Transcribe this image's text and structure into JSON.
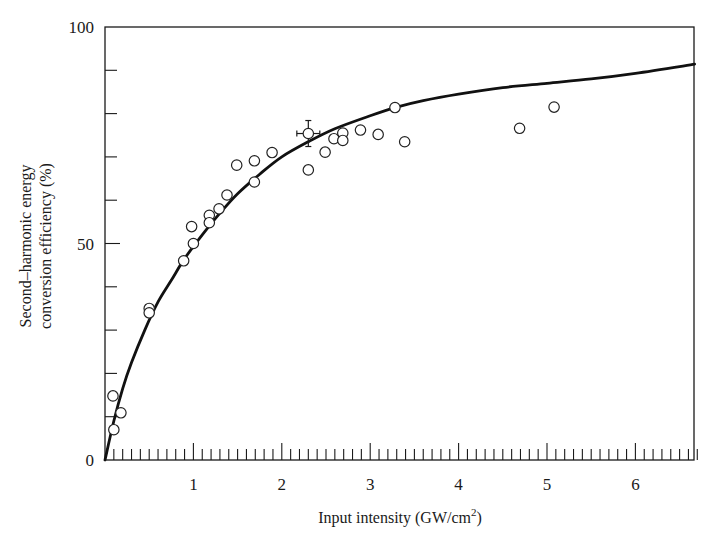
{
  "chart_data": {
    "type": "scatter",
    "title": "",
    "xlabel": "Input intensity (GW/cm²)",
    "xlabel_parts": {
      "main": "Input intensity (GW/cm",
      "sup": "2",
      "tail": ")"
    },
    "ylabel": "Second–harmonic energy conversion efficiency (%)",
    "ylabel_lines": [
      "Second–harmonic energy",
      "conversion efficiency (%)"
    ],
    "xlim": [
      0,
      6.7
    ],
    "ylim": [
      0,
      100
    ],
    "x_major_ticks": [
      1,
      2,
      3,
      4,
      5,
      6
    ],
    "x_minor_step": 0.1,
    "y_major_ticks": [
      0,
      50,
      100
    ],
    "y_minor_step": 10,
    "grid": false,
    "legend": null,
    "series": [
      {
        "name": "measured",
        "kind": "scatter",
        "marker": "open-circle",
        "points": [
          {
            "x": 0.09,
            "y": 14.8
          },
          {
            "x": 0.1,
            "y": 7.0
          },
          {
            "x": 0.18,
            "y": 10.9
          },
          {
            "x": 0.5,
            "y": 35.0
          },
          {
            "x": 0.5,
            "y": 34.0
          },
          {
            "x": 0.89,
            "y": 46.0
          },
          {
            "x": 0.98,
            "y": 53.9
          },
          {
            "x": 1.0,
            "y": 50.0
          },
          {
            "x": 1.18,
            "y": 56.5
          },
          {
            "x": 1.18,
            "y": 54.8
          },
          {
            "x": 1.29,
            "y": 58.0
          },
          {
            "x": 1.38,
            "y": 61.2
          },
          {
            "x": 1.49,
            "y": 68.1
          },
          {
            "x": 1.69,
            "y": 69.1
          },
          {
            "x": 1.69,
            "y": 64.2
          },
          {
            "x": 1.89,
            "y": 71.0
          },
          {
            "x": 2.3,
            "y": 75.4,
            "xerr": 0.13,
            "yerr": 3.0
          },
          {
            "x": 2.3,
            "y": 67.0
          },
          {
            "x": 2.49,
            "y": 71.1
          },
          {
            "x": 2.59,
            "y": 74.2
          },
          {
            "x": 2.69,
            "y": 75.5
          },
          {
            "x": 2.69,
            "y": 73.8
          },
          {
            "x": 2.89,
            "y": 76.2
          },
          {
            "x": 3.09,
            "y": 75.2
          },
          {
            "x": 3.28,
            "y": 81.4
          },
          {
            "x": 3.39,
            "y": 73.5
          },
          {
            "x": 4.69,
            "y": 76.6
          },
          {
            "x": 5.08,
            "y": 81.5
          }
        ]
      },
      {
        "name": "theory",
        "kind": "line",
        "points": [
          {
            "x": 0.0,
            "y": 0.0
          },
          {
            "x": 0.1,
            "y": 9.0
          },
          {
            "x": 0.2,
            "y": 16.5
          },
          {
            "x": 0.3,
            "y": 22.5
          },
          {
            "x": 0.45,
            "y": 30.0
          },
          {
            "x": 0.6,
            "y": 36.5
          },
          {
            "x": 0.75,
            "y": 41.5
          },
          {
            "x": 0.9,
            "y": 46.5
          },
          {
            "x": 1.1,
            "y": 52.0
          },
          {
            "x": 1.3,
            "y": 57.0
          },
          {
            "x": 1.5,
            "y": 61.5
          },
          {
            "x": 1.75,
            "y": 66.0
          },
          {
            "x": 2.0,
            "y": 70.0
          },
          {
            "x": 2.3,
            "y": 73.5
          },
          {
            "x": 2.6,
            "y": 76.5
          },
          {
            "x": 3.0,
            "y": 79.5
          },
          {
            "x": 3.3,
            "y": 81.5
          },
          {
            "x": 3.6,
            "y": 83.0
          },
          {
            "x": 4.0,
            "y": 84.5
          },
          {
            "x": 4.5,
            "y": 86.0
          },
          {
            "x": 5.0,
            "y": 87.0
          },
          {
            "x": 5.5,
            "y": 88.0
          },
          {
            "x": 6.0,
            "y": 89.3
          },
          {
            "x": 6.67,
            "y": 91.4
          }
        ]
      }
    ]
  }
}
